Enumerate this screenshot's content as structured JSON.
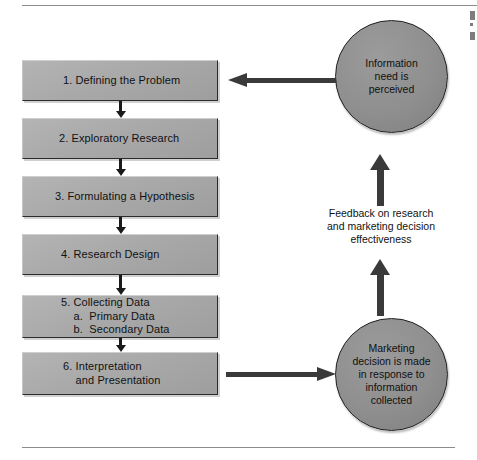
{
  "figure": {
    "colors": {
      "box_fill": "#a9a9a9",
      "box_border": "#2b2b2b",
      "circle_fill": "#8f8f8f",
      "circle_border": "#1f1f1f",
      "arrow": "#3a3a3a",
      "rule": "#8c8c8c",
      "text": "#111111",
      "background": "#ffffff"
    }
  },
  "process_steps": [
    {
      "id": "box1",
      "lines": [
        "1. Defining the Problem"
      ]
    },
    {
      "id": "box2",
      "lines": [
        "2. Exploratory Research"
      ]
    },
    {
      "id": "box3",
      "lines": [
        "3. Formulating a Hypothesis"
      ]
    },
    {
      "id": "box4",
      "lines": [
        "4. Research Design"
      ]
    },
    {
      "id": "box5",
      "lines": [
        "5. Collecting Data",
        "    a.  Primary Data",
        "    b.  Secondary Data"
      ]
    },
    {
      "id": "box6",
      "lines": [
        "6. Interpretation",
        "    and Presentation"
      ]
    }
  ],
  "circles": {
    "top": {
      "lines": [
        "Information",
        "need is",
        "perceived"
      ]
    },
    "bottom": {
      "lines": [
        "Marketing",
        "decision is made",
        "in response to",
        "information",
        "collected"
      ]
    }
  },
  "feedback_caption": {
    "lines": [
      "Feedback on research",
      "and marketing decision",
      "effectiveness"
    ]
  },
  "arrows": [
    {
      "name": "arrow-feedback-top",
      "direction": "left",
      "from": "Information need is perceived",
      "to": "1. Defining the Problem"
    },
    {
      "name": "arrow-to-decision",
      "direction": "right",
      "from": "6. Interpretation and Presentation",
      "to": "Marketing decision is made in response to information collected"
    },
    {
      "name": "uparrow-upper",
      "direction": "up",
      "from": "Feedback on research and marketing decision effectiveness",
      "to": "Information need is perceived"
    },
    {
      "name": "uparrow-lower",
      "direction": "up",
      "from": "Marketing decision is made in response to information collected",
      "to": "Feedback on research and marketing decision effectiveness"
    },
    {
      "name": "step-connector-1-2",
      "direction": "down"
    },
    {
      "name": "step-connector-2-3",
      "direction": "down"
    },
    {
      "name": "step-connector-3-4",
      "direction": "down"
    },
    {
      "name": "step-connector-4-5",
      "direction": "down"
    },
    {
      "name": "step-connector-5-6",
      "direction": "down"
    }
  ]
}
